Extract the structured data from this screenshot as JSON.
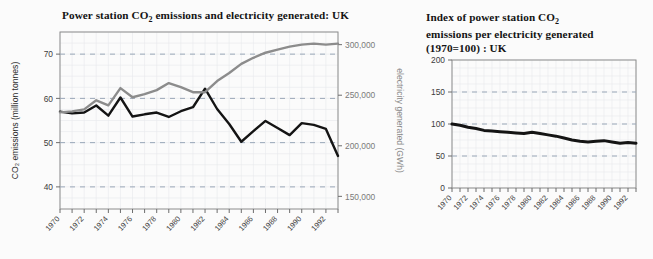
{
  "page": {
    "background": "#fbfbfb",
    "partial_heading_top": ""
  },
  "charts": {
    "left": {
      "title_prefix": "Power station CO",
      "title_sub": "2",
      "title_suffix": " emissions and electricity generated: UK",
      "title_full": "Power station CO2 emissions and electricity generated: UK",
      "frame_color": "#8c8c8c",
      "plot_bg": "#fdfdfd"
    },
    "right": {
      "title_line1_prefix": "Index of power station CO",
      "title_sub": "2",
      "title_line2": "emissions per electricity generated",
      "title_line3": "(1970=100) : UK",
      "title_full": "Index of power station CO2 emissions per electricity generated (1970=100) : UK",
      "frame_color": "#8c8c8c",
      "plot_bg": "#fdfdfd"
    }
  },
  "chart_data": [
    {
      "id": "left-chart",
      "type": "line",
      "title": "Power station CO2 emissions and electricity generated: UK",
      "xlabel": "",
      "ylabel": "CO2 emissions (million tonnes)",
      "y2label": "electricity generated (GWh)",
      "grid": true,
      "legend": "none",
      "x": [
        1970,
        1971,
        1972,
        1973,
        1974,
        1975,
        1976,
        1977,
        1978,
        1979,
        1980,
        1981,
        1982,
        1983,
        1984,
        1985,
        1986,
        1987,
        1988,
        1989,
        1990,
        1991,
        1992,
        1993
      ],
      "xlim": [
        1970,
        1993
      ],
      "xticks": [
        1970,
        1972,
        1974,
        1976,
        1978,
        1980,
        1982,
        1984,
        1986,
        1988,
        1990,
        1992
      ],
      "xticklabels": [
        "1970",
        "1972",
        "1974",
        "1976",
        "1978",
        "1980",
        "1982",
        "1984",
        "1986",
        "1988",
        "1990",
        "1992"
      ],
      "ylim": [
        35,
        75
      ],
      "yticks": [
        40,
        50,
        60,
        70
      ],
      "yticklabels": [
        "40",
        "50",
        "60",
        "70"
      ],
      "y2lim": [
        137500,
        312500
      ],
      "y2ticks": [
        150000,
        200000,
        250000,
        300000
      ],
      "y2ticklabels": [
        "150,000",
        "200,000",
        "250,000",
        "300,000"
      ],
      "series": [
        {
          "name": "CO2 emissions (million tonnes)",
          "axis": "left",
          "color": "#141414",
          "width": 2.4,
          "values": [
            57.0,
            56.6,
            56.8,
            58.4,
            56.1,
            60.2,
            55.9,
            56.4,
            56.8,
            55.8,
            57.1,
            58.0,
            62.2,
            57.6,
            54.2,
            50.2,
            52.6,
            54.9,
            53.3,
            51.7,
            54.4,
            54.0,
            53.1,
            47.0
          ]
        },
        {
          "name": "electricity generated (GWh)",
          "axis": "right",
          "color": "#8c8c8c",
          "width": 2.4,
          "values": [
            233000,
            234000,
            236000,
            245000,
            240000,
            257000,
            248000,
            251000,
            255000,
            262000,
            258000,
            253000,
            253000,
            264000,
            272000,
            281000,
            287000,
            292000,
            295000,
            298000,
            300000,
            301000,
            300000,
            301000
          ]
        }
      ]
    },
    {
      "id": "right-chart",
      "type": "line",
      "title": "Index of power station CO2 emissions per electricity generated (1970=100) : UK",
      "xlabel": "",
      "ylabel": "",
      "grid": true,
      "legend": "none",
      "x": [
        1970,
        1971,
        1972,
        1973,
        1974,
        1975,
        1976,
        1977,
        1978,
        1979,
        1980,
        1981,
        1982,
        1983,
        1984,
        1985,
        1986,
        1987,
        1988,
        1989,
        1990,
        1991,
        1992,
        1993
      ],
      "xlim": [
        1970,
        1993
      ],
      "xticks": [
        1970,
        1972,
        1974,
        1976,
        1978,
        1980,
        1982,
        1984,
        1986,
        1988,
        1990,
        1992
      ],
      "xticklabels": [
        "1970",
        "1972",
        "1974",
        "1976",
        "1978",
        "1980",
        "1982",
        "1984",
        "1986",
        "1988",
        "1990",
        "1992"
      ],
      "ylim": [
        0,
        200
      ],
      "yticks": [
        0,
        50,
        100,
        150,
        200
      ],
      "yticklabels": [
        "0",
        "50",
        "100",
        "150",
        "200"
      ],
      "series": [
        {
          "name": "Index of CO2 per electricity generated (1970=100)",
          "axis": "left",
          "color": "#141414",
          "width": 3.0,
          "values": [
            100,
            98,
            95,
            93,
            90,
            89,
            88,
            87,
            86,
            85,
            87,
            85,
            83,
            81,
            78,
            75,
            73,
            72,
            73,
            74,
            72,
            70,
            71,
            70
          ]
        }
      ]
    }
  ]
}
